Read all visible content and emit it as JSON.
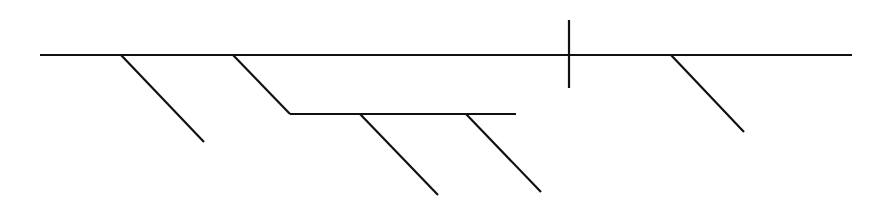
{
  "diagram": {
    "type": "sentence-diagram",
    "style": "Reed-Kellogg",
    "labels": [],
    "stroke_color": "#111111",
    "background": "#ffffff",
    "lines": [
      {
        "name": "baseline",
        "x1": 40,
        "y1": 55,
        "x2": 852,
        "y2": 55
      },
      {
        "name": "subject-predicate-divider",
        "x1": 569,
        "y1": 20,
        "x2": 569,
        "y2": 88
      },
      {
        "name": "modifier-1",
        "x1": 121,
        "y1": 55,
        "x2": 204,
        "y2": 142
      },
      {
        "name": "preposition-slant",
        "x1": 233,
        "y1": 55,
        "x2": 290,
        "y2": 114
      },
      {
        "name": "prepositional-object-line",
        "x1": 290,
        "y1": 114,
        "x2": 516,
        "y2": 114
      },
      {
        "name": "object-modifier-1",
        "x1": 360,
        "y1": 114,
        "x2": 438,
        "y2": 195
      },
      {
        "name": "object-modifier-2",
        "x1": 466,
        "y1": 114,
        "x2": 541,
        "y2": 192
      },
      {
        "name": "predicate-modifier",
        "x1": 671,
        "y1": 55,
        "x2": 744,
        "y2": 132
      }
    ]
  }
}
